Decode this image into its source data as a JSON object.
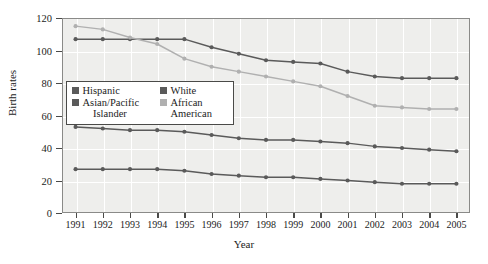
{
  "chart_data": {
    "type": "line",
    "title": "",
    "xlabel": "Year",
    "ylabel": "Birth rates",
    "x": [
      1991,
      1992,
      1993,
      1994,
      1995,
      1996,
      1997,
      1998,
      1999,
      2000,
      2001,
      2002,
      2003,
      2004,
      2005
    ],
    "xlim": [
      1990.5,
      2005.5
    ],
    "ylim": [
      0,
      120
    ],
    "yticks": [
      0,
      20,
      40,
      60,
      80,
      100,
      120
    ],
    "xticks": [
      "1991",
      "1992",
      "1993",
      "1994",
      "1995",
      "1996",
      "1997",
      "1998",
      "1999",
      "2000",
      "2001",
      "2002",
      "2003",
      "2004",
      "2005"
    ],
    "grid": true,
    "legend_position": "inside-upper-left",
    "series": [
      {
        "name": "Hispanic",
        "color": "#5a5a5a",
        "values": [
          107,
          107,
          107,
          107,
          107,
          102,
          98,
          94,
          93,
          92,
          87,
          84,
          83,
          83,
          83
        ]
      },
      {
        "name": "African American",
        "color": "#b0b0b0",
        "values": [
          115,
          113,
          108,
          104,
          95,
          90,
          87,
          84,
          81,
          78,
          72,
          66,
          65,
          64,
          64
        ]
      },
      {
        "name": "White",
        "color": "#5a5a5a",
        "values": [
          53,
          52,
          51,
          51,
          50,
          48,
          46,
          45,
          45,
          44,
          43,
          41,
          40,
          39,
          38
        ]
      },
      {
        "name": "Asian/Pacific Islander",
        "color": "#5a5a5a",
        "values": [
          27,
          27,
          27,
          27,
          26,
          24,
          23,
          22,
          22,
          21,
          20,
          19,
          18,
          18,
          18
        ]
      }
    ]
  },
  "legend": {
    "entries": [
      {
        "label": "Hispanic",
        "color": "#5a5a5a",
        "column": "left",
        "row": 0
      },
      {
        "label": "White",
        "color": "#5a5a5a",
        "column": "right",
        "row": 0
      },
      {
        "label": "Asian/Pacific\nIslander",
        "color": "#5a5a5a",
        "column": "left",
        "row": 1
      },
      {
        "label": "African\nAmerican",
        "color": "#b0b0b0",
        "column": "right",
        "row": 1
      }
    ],
    "l0_label": "Hispanic",
    "l1_label": "Asian/Pacific",
    "l1_label2": "Islander",
    "r0_label": "White",
    "r1_label": "African",
    "r1_label2": "American"
  },
  "axis": {
    "y_title": "Birth rates",
    "x_title": "Year"
  }
}
